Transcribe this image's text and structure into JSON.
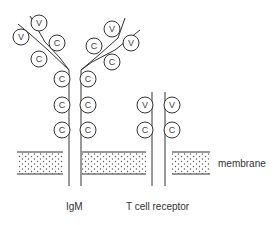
{
  "labels": {
    "igm": "IgM",
    "tcr": "T cell receptor",
    "membrane": "membrane"
  },
  "domains": {
    "v": "V",
    "c": "C"
  },
  "colors": {
    "line": "#333333",
    "dots": "#555555",
    "background": "#ffffff"
  }
}
